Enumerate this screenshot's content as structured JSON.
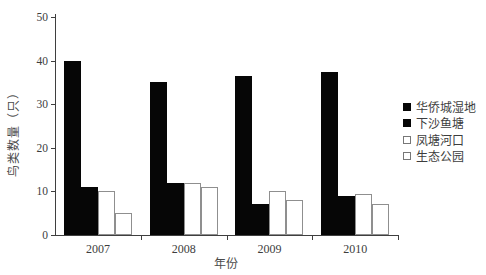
{
  "chart_data": {
    "type": "bar",
    "title": "",
    "xlabel": "年份",
    "ylabel": "鸟类数量（只）",
    "categories": [
      "2007",
      "2008",
      "2009",
      "2010"
    ],
    "series": [
      {
        "name": "华侨城湿地",
        "fill": "black",
        "values": [
          40,
          35,
          36.5,
          37.5
        ]
      },
      {
        "name": "下沙鱼塘",
        "fill": "black",
        "values": [
          11,
          12,
          7,
          9
        ]
      },
      {
        "name": "凤塘河口",
        "fill": "white",
        "values": [
          10,
          12,
          10,
          9.5
        ]
      },
      {
        "name": "生态公园",
        "fill": "white",
        "values": [
          5,
          11,
          8,
          7
        ]
      }
    ],
    "ylim": [
      0,
      50
    ],
    "yticks": [
      0,
      10,
      20,
      30,
      40,
      50
    ],
    "grid": false,
    "legend_position": "right-middle",
    "colors": {
      "bar_filled": "#060606",
      "bar_hollow": "#ffffff",
      "bar_outline": "#8f8f8f",
      "axis": "#3f3f3f",
      "text": "#3d3d3d"
    }
  }
}
